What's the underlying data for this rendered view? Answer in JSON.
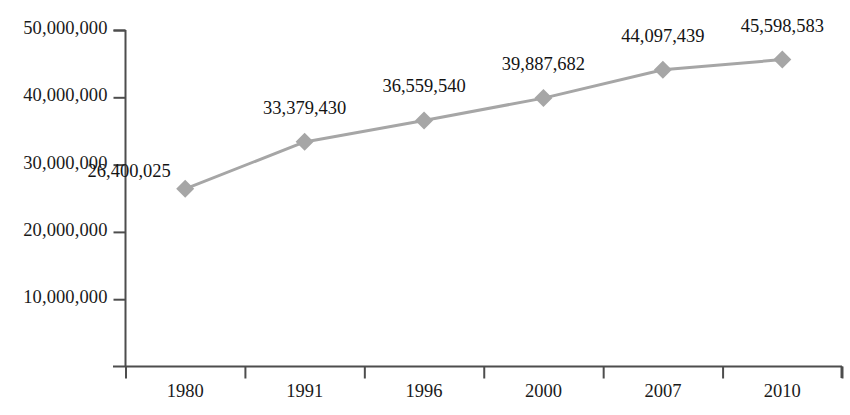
{
  "chart_data": {
    "type": "line",
    "title": "",
    "subtitle": "",
    "xlabel": "",
    "ylabel": "",
    "categories": [
      "1980",
      "1991",
      "1996",
      "2000",
      "2007",
      "2010"
    ],
    "values": [
      26400025,
      33379430,
      36559540,
      39887682,
      44097439,
      45598583
    ],
    "point_labels": [
      "26,400,025",
      "33,379,430",
      "36,559,540",
      "39,887,682",
      "44,097,439",
      "45,598,583"
    ],
    "series": [
      {
        "name": "",
        "values": [
          26400025,
          33379430,
          36559540,
          39887682,
          44097439,
          45598583
        ]
      }
    ],
    "ylim": [
      0,
      50000000
    ],
    "yticks": [
      10000000,
      20000000,
      30000000,
      40000000,
      50000000
    ],
    "ytick_labels": [
      "10,000,000",
      "20,000,000",
      "30,000,000",
      "40,000,000",
      "50,000,000"
    ],
    "grid": false,
    "legend": false,
    "legend_position": "none",
    "marker": "diamond",
    "line_color": "#a6a6a6",
    "marker_color": "#a6a6a6",
    "axis_color": "#4d4d4d",
    "text_color": "#141414",
    "background_color": "#ffffff"
  }
}
